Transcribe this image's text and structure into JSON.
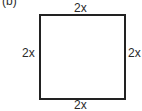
{
  "figure": {
    "panel_label": "(b)",
    "shape": "square",
    "sides": {
      "top": "2x",
      "left": "2x",
      "right": "2x",
      "bottom": "2x"
    }
  }
}
